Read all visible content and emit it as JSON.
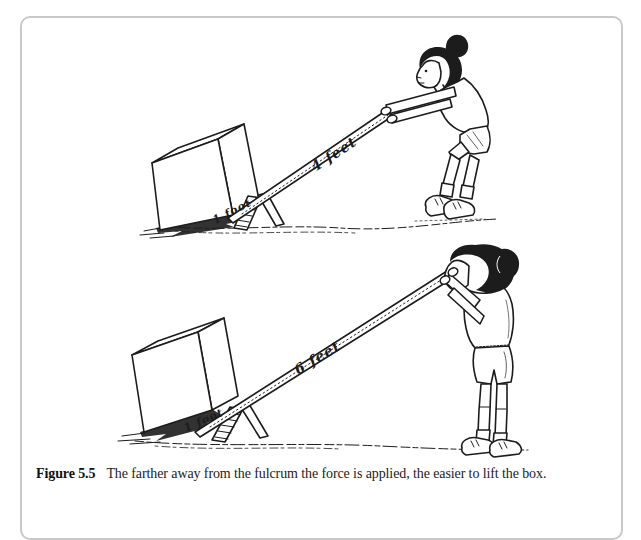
{
  "figure": {
    "caption_label": "Figure 5.5",
    "caption_text": "The farther away from the fulcrum the force is applied, the easier to lift the box."
  },
  "top_illustration": {
    "long_arm_label": "4 feet",
    "short_arm_label": "1 foot"
  },
  "bottom_illustration": {
    "long_arm_label": "6 feet",
    "short_arm_label": "1 foot"
  },
  "colors": {
    "ink": "#1c1c1c",
    "border": "#c9c9c9",
    "paper": "#ffffff"
  }
}
